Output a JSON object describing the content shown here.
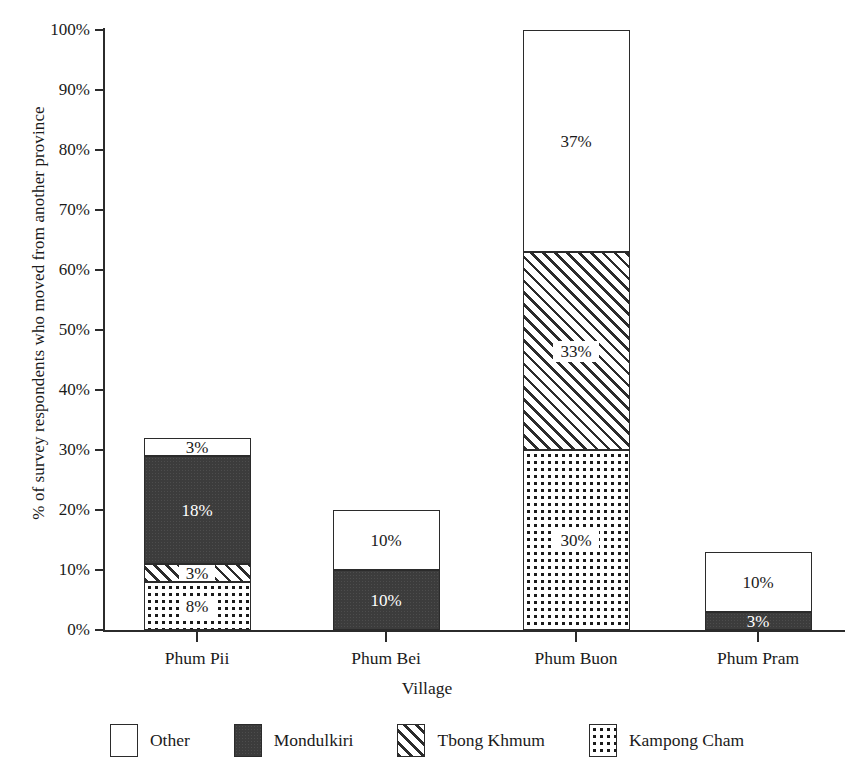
{
  "chart_data": {
    "type": "bar",
    "subtype": "stacked-bar",
    "title": "",
    "xlabel": "Village",
    "ylabel": "% of survey respondents who moved from another province",
    "categories": [
      "Phum Pii",
      "Phum Bei",
      "Phum Buon",
      "Phum Pram"
    ],
    "ylim": [
      0,
      100
    ],
    "yticks": [
      0,
      10,
      20,
      30,
      40,
      50,
      60,
      70,
      80,
      90,
      100
    ],
    "ytick_labels": [
      "0%",
      "10%",
      "20%",
      "30%",
      "40%",
      "50%",
      "60%",
      "70%",
      "80%",
      "90%",
      "100%"
    ],
    "grid": false,
    "legend_position": "bottom",
    "stack_order_bottom_to_top": [
      "Kampong Cham",
      "Tbong Khmum",
      "Mondulkiri",
      "Other"
    ],
    "series": [
      {
        "name": "Kampong Cham",
        "pattern": "dotted",
        "color": "#ffffff",
        "values": [
          8,
          0,
          30,
          0
        ],
        "labels": [
          "8%",
          "",
          "30%",
          ""
        ]
      },
      {
        "name": "Tbong Khmum",
        "pattern": "diagonal-hatch",
        "color": "#ffffff",
        "values": [
          3,
          0,
          33,
          0
        ],
        "labels": [
          "3%",
          "",
          "33%",
          ""
        ]
      },
      {
        "name": "Mondulkiri",
        "pattern": "solid-dark",
        "color": "#3c3c3c",
        "values": [
          18,
          10,
          0,
          3
        ],
        "labels": [
          "18%",
          "10%",
          "",
          "3%"
        ]
      },
      {
        "name": "Other",
        "pattern": "empty",
        "color": "#ffffff",
        "values": [
          3,
          10,
          37,
          10
        ],
        "labels": [
          "3%",
          "10%",
          "37%",
          "10%"
        ]
      }
    ],
    "totals": [
      32,
      20,
      100,
      13
    ]
  },
  "axes": {
    "y_label": "% of survey respondents who moved from another province",
    "x_label": "Village",
    "y_ticks": [
      {
        "label": "100%"
      },
      {
        "label": "90%"
      },
      {
        "label": "80%"
      },
      {
        "label": "70%"
      },
      {
        "label": "60%"
      },
      {
        "label": "50%"
      },
      {
        "label": "40%"
      },
      {
        "label": "30%"
      },
      {
        "label": "20%"
      },
      {
        "label": "10%"
      },
      {
        "label": "0%"
      }
    ],
    "x_ticks": [
      {
        "label": "Phum Pii"
      },
      {
        "label": "Phum Bei"
      },
      {
        "label": "Phum Buon"
      },
      {
        "label": "Phum Pram"
      }
    ]
  },
  "bars": [
    {
      "category": "Phum Pii",
      "segments": [
        {
          "series": "Kampong Cham",
          "value": 8,
          "label": "8%",
          "fill": "f-kampong"
        },
        {
          "series": "Tbong Khmum",
          "value": 3,
          "label": "3%",
          "fill": "f-tbong"
        },
        {
          "series": "Mondulkiri",
          "value": 18,
          "label": "18%",
          "fill": "f-mondulkiri"
        },
        {
          "series": "Other",
          "value": 3,
          "label": "3%",
          "fill": "f-other"
        }
      ]
    },
    {
      "category": "Phum Bei",
      "segments": [
        {
          "series": "Mondulkiri",
          "value": 10,
          "label": "10%",
          "fill": "f-mondulkiri"
        },
        {
          "series": "Other",
          "value": 10,
          "label": "10%",
          "fill": "f-other"
        }
      ]
    },
    {
      "category": "Phum Buon",
      "segments": [
        {
          "series": "Kampong Cham",
          "value": 30,
          "label": "30%",
          "fill": "f-kampong"
        },
        {
          "series": "Tbong Khmum",
          "value": 33,
          "label": "33%",
          "fill": "f-tbong"
        },
        {
          "series": "Other",
          "value": 37,
          "label": "37%",
          "fill": "f-other"
        }
      ]
    },
    {
      "category": "Phum Pram",
      "segments": [
        {
          "series": "Mondulkiri",
          "value": 3,
          "label": "3%",
          "fill": "f-mondulkiri"
        },
        {
          "series": "Other",
          "value": 10,
          "label": "10%",
          "fill": "f-other"
        }
      ]
    }
  ],
  "legend": {
    "items": [
      {
        "label": "Other",
        "fill": "f-other"
      },
      {
        "label": "Mondulkiri",
        "fill": "f-mondulkiri"
      },
      {
        "label": "Tbong Khmum",
        "fill": "f-tbong"
      },
      {
        "label": "Kampong Cham",
        "fill": "f-kampong"
      }
    ]
  },
  "colors": {
    "axis": "#2b2b2b",
    "text": "#1a1a1a",
    "mondulkiri": "#3c3c3c",
    "background": "#ffffff"
  }
}
